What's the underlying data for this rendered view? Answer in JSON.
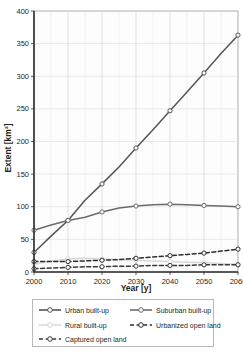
{
  "chart_data": {
    "type": "line",
    "title": "",
    "xlabel": "Year [y]",
    "ylabel": "Extent [km²]",
    "xlim": [
      2000,
      2060
    ],
    "ylim": [
      0,
      400
    ],
    "xticks": [
      "2000",
      "2010",
      "2020",
      "2030",
      "2040",
      "2050",
      "2060"
    ],
    "yticks": [
      "0",
      "50",
      "100",
      "150",
      "200",
      "250",
      "300",
      "350",
      "400"
    ],
    "grid": true,
    "legend_position": "bottom",
    "x": [
      2000,
      2005,
      2010,
      2015,
      2020,
      2025,
      2030,
      2035,
      2040,
      2045,
      2050,
      2055,
      2060
    ],
    "series": [
      {
        "name": "Urban built-up",
        "color": "#555555",
        "style": "solid",
        "marker": "open-circle",
        "values": [
          30,
          55,
          79,
          110,
          135,
          161,
          190,
          218,
          247,
          276,
          305,
          335,
          363
        ]
      },
      {
        "name": "Suburban built-up",
        "color": "#6b6b6b",
        "style": "solid",
        "marker": "open-circle",
        "values": [
          64,
          72,
          79,
          84,
          92,
          98,
          101,
          103,
          104,
          103,
          102,
          101,
          100
        ]
      },
      {
        "name": "Rural built-up",
        "color": "#d7d7d7",
        "style": "solid",
        "marker": "open-circle",
        "values": [
          12,
          17,
          20,
          21,
          20,
          19,
          18,
          17,
          16,
          15,
          14,
          13,
          12
        ]
      },
      {
        "name": "Urbanized open land",
        "color": "#2e2e2e",
        "style": "dashed",
        "marker": "open-circle",
        "values": [
          16,
          16,
          16,
          17,
          18,
          19,
          21,
          23,
          25,
          27,
          29,
          32,
          35
        ]
      },
      {
        "name": "Captured open land",
        "color": "#3a3a3a",
        "style": "dashed",
        "marker": "open-circle",
        "values": [
          5,
          6,
          7,
          8,
          8,
          9,
          9,
          10,
          10,
          10,
          11,
          11,
          11
        ]
      }
    ]
  },
  "legend": {
    "entries": [
      {
        "label": "Urban built-up"
      },
      {
        "label": "Suburban built-up"
      },
      {
        "label": "Rural built-up"
      },
      {
        "label": "Urbanized open land"
      },
      {
        "label": "Captured open land"
      }
    ]
  }
}
